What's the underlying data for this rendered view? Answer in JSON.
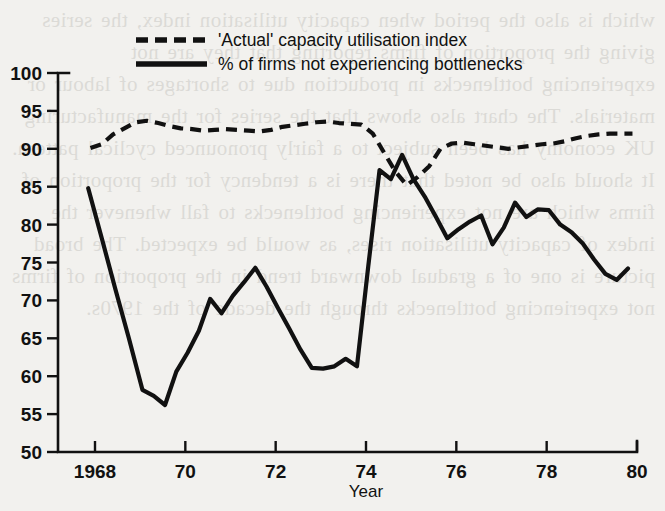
{
  "page": {
    "background_color": "#f2f1ee",
    "ink_color": "#111111",
    "bleed_through_text": "which is also the period when capacity utilisation index, the series giving the proportion of firms reporting that they are not experiencing bottlenecks in production due to shortages of labour or materials. The chart also shows that the series for the manufacturing UK economy has been subject to a fairly pronounced cyclical pattern. It should also be noted that there is a tendency for the proportion of firms which are not experiencing bottlenecks to fall whenever the index of capacity utilisation rises, as would be expected. The broad picture is one of a gradual downward trend in the proportion of firms not experiencing bottlenecks through the decade of the 1970s."
  },
  "chart_data": {
    "type": "line",
    "title": "",
    "xlabel": "Year",
    "ylabel": "",
    "xlim": [
      1967.75,
      1980.0
    ],
    "ylim": [
      50,
      100
    ],
    "grid": false,
    "legend_position": "top",
    "x_ticks": [
      {
        "value": 1968,
        "label": "1968"
      },
      {
        "value": 1970,
        "label": "70"
      },
      {
        "value": 1972,
        "label": "72"
      },
      {
        "value": 1974,
        "label": "74"
      },
      {
        "value": 1976,
        "label": "76"
      },
      {
        "value": 1978,
        "label": "78"
      },
      {
        "value": 1980,
        "label": "80"
      }
    ],
    "y_ticks": [
      {
        "value": 50,
        "label": "50"
      },
      {
        "value": 55,
        "label": "55"
      },
      {
        "value": 60,
        "label": "60"
      },
      {
        "value": 65,
        "label": "65"
      },
      {
        "value": 70,
        "label": "70"
      },
      {
        "value": 75,
        "label": "75"
      },
      {
        "value": 80,
        "label": "80"
      },
      {
        "value": 85,
        "label": "85"
      },
      {
        "value": 90,
        "label": "90"
      },
      {
        "value": 95,
        "label": "95"
      },
      {
        "value": 100,
        "label": "100"
      }
    ],
    "series": [
      {
        "name": "'Actual' capacity utilisation index",
        "style": "dashed",
        "color": "#111111",
        "x": [
          1967.9,
          1968.15,
          1968.4,
          1968.65,
          1968.9,
          1969.15,
          1969.4,
          1969.65,
          1969.9,
          1970.15,
          1970.4,
          1970.65,
          1970.9,
          1971.15,
          1971.4,
          1971.65,
          1971.9,
          1972.15,
          1972.4,
          1972.65,
          1972.9,
          1973.15,
          1973.4,
          1973.65,
          1973.9,
          1974.15,
          1974.4,
          1974.65,
          1974.9,
          1975.15,
          1975.4,
          1975.65,
          1975.9,
          1976.15,
          1976.4,
          1976.65,
          1976.9,
          1977.15,
          1977.4,
          1977.65,
          1977.9,
          1978.15,
          1978.4,
          1978.65,
          1978.9,
          1979.15,
          1979.4,
          1979.65,
          1979.9
        ],
        "values": [
          90.1,
          90.6,
          91.9,
          92.7,
          93.5,
          93.7,
          93.4,
          93.0,
          92.7,
          92.6,
          92.4,
          92.5,
          92.6,
          92.5,
          92.4,
          92.3,
          92.5,
          92.9,
          93.1,
          93.3,
          93.5,
          93.6,
          93.4,
          93.3,
          93.2,
          92.0,
          89.5,
          87.0,
          85.2,
          86.3,
          87.7,
          90.0,
          90.7,
          90.8,
          90.6,
          90.4,
          90.2,
          90.0,
          90.2,
          90.4,
          90.6,
          90.7,
          91.0,
          91.4,
          91.7,
          91.9,
          92.0,
          92.0,
          92.0
        ]
      },
      {
        "name": "% of firms not experiencing bottlenecks",
        "style": "solid",
        "color": "#111111",
        "x": [
          1967.85,
          1968.15,
          1968.45,
          1968.75,
          1969.05,
          1969.3,
          1969.55,
          1969.8,
          1970.05,
          1970.3,
          1970.55,
          1970.8,
          1971.05,
          1971.3,
          1971.55,
          1971.8,
          1972.05,
          1972.3,
          1972.55,
          1972.8,
          1973.05,
          1973.3,
          1973.55,
          1973.8,
          1974.05,
          1974.3,
          1974.55,
          1974.8,
          1975.05,
          1975.3,
          1975.55,
          1975.8,
          1976.05,
          1976.3,
          1976.55,
          1976.8,
          1977.05,
          1977.3,
          1977.55,
          1977.8,
          1978.05,
          1978.3,
          1978.55,
          1978.8,
          1979.05,
          1979.3,
          1979.55,
          1979.8
        ],
        "values": [
          84.8,
          78.2,
          71.5,
          65.0,
          58.2,
          57.4,
          56.2,
          60.6,
          63.1,
          66.0,
          70.2,
          68.3,
          70.6,
          72.4,
          74.3,
          71.8,
          69.0,
          66.3,
          63.5,
          61.1,
          61.0,
          61.3,
          62.3,
          61.3,
          74.5,
          87.2,
          86.0,
          89.2,
          86.0,
          83.7,
          81.0,
          78.2,
          79.4,
          80.4,
          81.2,
          77.4,
          79.6,
          82.9,
          81.0,
          82.0,
          81.9,
          80.0,
          79.0,
          77.5,
          75.4,
          73.5,
          72.7,
          74.2
        ]
      }
    ]
  },
  "legend": {
    "items": [
      {
        "label": "'Actual' capacity utilisation index",
        "style": "dashed"
      },
      {
        "label": "% of firms not experiencing bottlenecks",
        "style": "solid"
      }
    ]
  },
  "axis_titles": {
    "x": "Year"
  }
}
